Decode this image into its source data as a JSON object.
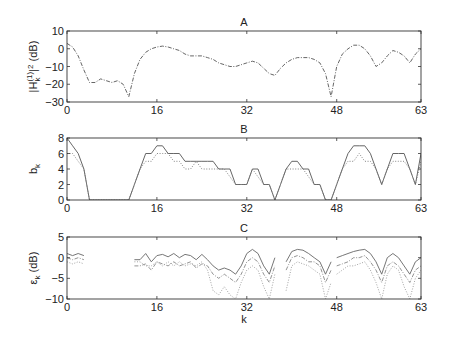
{
  "chart_data": [
    {
      "type": "line",
      "title": "A",
      "xlabel": "",
      "ylabel": "|H_k^(1)|^2 (dB)",
      "xlim": [
        0,
        63
      ],
      "ylim": [
        -30,
        10
      ],
      "xticks": [
        0,
        16,
        32,
        48,
        63
      ],
      "yticks": [
        -30,
        -20,
        -10,
        0,
        10
      ],
      "grid": false,
      "series": [
        {
          "name": "response",
          "style": "dash-dot",
          "color": "#555555",
          "x": [
            0,
            1,
            2,
            3,
            4,
            5,
            6,
            7,
            8,
            9,
            10,
            11,
            12,
            13,
            14,
            15,
            16,
            17,
            18,
            19,
            20,
            21,
            22,
            23,
            24,
            25,
            26,
            27,
            28,
            29,
            30,
            31,
            32,
            33,
            34,
            35,
            36,
            37,
            38,
            39,
            40,
            41,
            42,
            43,
            44,
            45,
            46,
            47,
            48,
            49,
            50,
            51,
            52,
            53,
            54,
            55,
            56,
            57,
            58,
            59,
            60,
            61,
            62,
            63
          ],
          "y": [
            3,
            1,
            -4,
            -12,
            -19,
            -19,
            -17,
            -18,
            -19,
            -18,
            -20,
            -27,
            -14,
            -6,
            -2,
            0,
            1,
            1.5,
            1,
            0,
            -1,
            -3,
            -4,
            -4,
            -4,
            -5,
            -6,
            -8,
            -9,
            -10,
            -10,
            -9,
            -8,
            -7,
            -8,
            -11,
            -14,
            -15,
            -11,
            -8,
            -6,
            -5,
            -5,
            -5,
            -6,
            -8,
            -14,
            -27,
            -10,
            -3,
            0,
            2,
            2,
            0,
            -4,
            -10,
            -8,
            -4,
            -1,
            -2,
            -4,
            -8,
            -3,
            0
          ]
        }
      ]
    },
    {
      "type": "line",
      "title": "B",
      "xlabel": "",
      "ylabel": "b_k",
      "xlim": [
        0,
        63
      ],
      "ylim": [
        0,
        8
      ],
      "xticks": [
        0,
        16,
        32,
        48,
        63
      ],
      "yticks": [
        0,
        2,
        4,
        6,
        8
      ],
      "grid": false,
      "series": [
        {
          "name": "allocation-1",
          "style": "solid",
          "color": "#555555",
          "x": [
            0,
            1,
            2,
            3,
            4,
            5,
            6,
            7,
            8,
            9,
            10,
            11,
            12,
            13,
            14,
            15,
            16,
            17,
            18,
            19,
            20,
            21,
            22,
            23,
            24,
            25,
            26,
            27,
            28,
            29,
            30,
            31,
            32,
            33,
            34,
            35,
            36,
            37,
            38,
            39,
            40,
            41,
            42,
            43,
            44,
            45,
            46,
            47,
            48,
            49,
            50,
            51,
            52,
            53,
            54,
            55,
            56,
            57,
            58,
            59,
            60,
            61,
            62,
            63
          ],
          "y": [
            8,
            7,
            6,
            4,
            0,
            0,
            0,
            0,
            0,
            0,
            0,
            0,
            2,
            4,
            6,
            6,
            7,
            7,
            6,
            6,
            6,
            5,
            5,
            5,
            5,
            5,
            5,
            4,
            4,
            4,
            2,
            2,
            2,
            4,
            4,
            2,
            2,
            0,
            2,
            4,
            5,
            5,
            4,
            4,
            2,
            2,
            0,
            0,
            2,
            4,
            6,
            7,
            7,
            7,
            6,
            4,
            2,
            4,
            6,
            6,
            6,
            4,
            2,
            6
          ]
        },
        {
          "name": "allocation-2",
          "style": "dotted",
          "color": "#777777",
          "x": [
            0,
            1,
            2,
            3,
            4,
            5,
            6,
            7,
            8,
            9,
            10,
            11,
            12,
            13,
            14,
            15,
            16,
            17,
            18,
            19,
            20,
            21,
            22,
            23,
            24,
            25,
            26,
            27,
            28,
            29,
            30,
            31,
            32,
            33,
            34,
            35,
            36,
            37,
            38,
            39,
            40,
            41,
            42,
            43,
            44,
            45,
            46,
            47,
            48,
            49,
            50,
            51,
            52,
            53,
            54,
            55,
            56,
            57,
            58,
            59,
            60,
            61,
            62,
            63
          ],
          "y": [
            6,
            6,
            5,
            4,
            0,
            0,
            0,
            0,
            0,
            0,
            0,
            0,
            2,
            4,
            5,
            5,
            6,
            6,
            6,
            5,
            5,
            4,
            4,
            5,
            4,
            4,
            4,
            4,
            4,
            3,
            2,
            2,
            2,
            4,
            3,
            2,
            2,
            0,
            2,
            4,
            4,
            4,
            4,
            3,
            2,
            2,
            0,
            0,
            2,
            4,
            5,
            5,
            6,
            5,
            5,
            4,
            2,
            4,
            5,
            5,
            5,
            4,
            2,
            5
          ]
        }
      ]
    },
    {
      "type": "line",
      "title": "C",
      "xlabel": "k",
      "ylabel": "ε_k (dB)",
      "xlim": [
        0,
        63
      ],
      "ylim": [
        -10,
        5
      ],
      "xticks": [
        0,
        16,
        32,
        48,
        63
      ],
      "yticks": [
        -10,
        -5,
        0,
        5
      ],
      "grid": false,
      "series": [
        {
          "name": "error-1",
          "style": "solid",
          "color": "#666666",
          "segments": [
            {
              "x": [
                0,
                1,
                2,
                3
              ],
              "y": [
                1,
                0.5,
                1,
                0.5
              ]
            },
            {
              "x": [
                12,
                13,
                14,
                15,
                16,
                17,
                18,
                19,
                20,
                21,
                22,
                23,
                24,
                25,
                26,
                27,
                28,
                29,
                30,
                31,
                32,
                33,
                34,
                35,
                36,
                37
              ],
              "y": [
                -0.5,
                -0.5,
                1,
                -1,
                0.5,
                0.8,
                0.2,
                1,
                0,
                0.8,
                0.5,
                -0.5,
                0.8,
                -0.5,
                -2,
                -3,
                -2.5,
                -3,
                -4,
                -2,
                1,
                2,
                1,
                -2,
                -4,
                0
              ]
            },
            {
              "x": [
                39,
                40,
                41,
                42,
                43,
                44,
                45,
                46,
                47
              ],
              "y": [
                -1,
                1.5,
                2,
                1.8,
                1,
                0,
                -1,
                -4,
                -1
              ]
            },
            {
              "x": [
                48,
                49,
                50,
                51,
                52,
                53,
                54,
                55,
                56,
                57,
                58,
                59,
                60,
                61,
                62,
                63
              ],
              "y": [
                0,
                0.5,
                1,
                1.5,
                1.8,
                2,
                1,
                -1,
                -4,
                0,
                1,
                0,
                -2,
                -4,
                -1,
                0
              ]
            }
          ]
        },
        {
          "name": "error-2",
          "style": "dash-dot",
          "color": "#888888",
          "segments": [
            {
              "x": [
                0,
                1,
                2,
                3
              ],
              "y": [
                0,
                -0.5,
                0,
                -0.5
              ]
            },
            {
              "x": [
                12,
                13,
                14,
                15,
                16,
                17,
                18,
                19,
                20,
                21,
                22,
                23,
                24,
                25,
                26,
                27,
                28,
                29,
                30,
                31,
                32,
                33,
                34,
                35,
                36,
                37
              ],
              "y": [
                -2,
                -2,
                -1.5,
                -3,
                -1,
                -1.5,
                -2,
                -1,
                -2,
                -1.5,
                -1,
                -2.5,
                -1.5,
                -2,
                -4,
                -5,
                -4,
                -5,
                -6,
                -4,
                -1,
                0,
                -1,
                -4,
                -6,
                -2
              ]
            },
            {
              "x": [
                39,
                40,
                41,
                42,
                43,
                44,
                45,
                46,
                47
              ],
              "y": [
                -3,
                0,
                0.5,
                0,
                -1,
                -1,
                -2,
                -6,
                -3
              ]
            },
            {
              "x": [
                48,
                49,
                50,
                51,
                52,
                53,
                54,
                55,
                56,
                57,
                58,
                59,
                60,
                61,
                62,
                63
              ],
              "y": [
                -2,
                -1.5,
                -1,
                0,
                0,
                0.5,
                -1,
                -3,
                -6,
                -2,
                -1,
                -2,
                -4,
                -6,
                -3,
                -2
              ]
            }
          ]
        },
        {
          "name": "error-3",
          "style": "dotted",
          "color": "#999999",
          "segments": [
            {
              "x": [
                0,
                1,
                2,
                3
              ],
              "y": [
                -1,
                -1.5,
                -1,
                -1.5
              ]
            },
            {
              "x": [
                12,
                13,
                14,
                15,
                16,
                17,
                18,
                19,
                20,
                21,
                22,
                23,
                24,
                25,
                26,
                27,
                28,
                29,
                30,
                31,
                32,
                33,
                34,
                35,
                36,
                37
              ],
              "y": [
                -1,
                -1,
                -2,
                -2,
                -1,
                -2,
                -1,
                -2,
                -1,
                -2,
                -1.5,
                -2,
                -1,
                -3,
                -8,
                -9,
                -7,
                -9,
                -10,
                -6,
                -3,
                -2,
                -3,
                -7,
                -10,
                -4
              ]
            },
            {
              "x": [
                39,
                40,
                41,
                42,
                43,
                44,
                45,
                46,
                47
              ],
              "y": [
                -8,
                -2,
                -1,
                -1.5,
                -2,
                -3,
                -4,
                -10,
                -6
              ]
            },
            {
              "x": [
                48,
                49,
                50,
                51,
                52,
                53,
                54,
                55,
                56,
                57,
                58,
                59,
                60,
                61,
                62,
                63
              ],
              "y": [
                -4,
                -3,
                -2,
                -2,
                -1.5,
                -1,
                -3,
                -6,
                -10,
                -4,
                -2,
                -3,
                -7,
                -10,
                -5,
                -3
              ]
            }
          ]
        }
      ]
    }
  ]
}
